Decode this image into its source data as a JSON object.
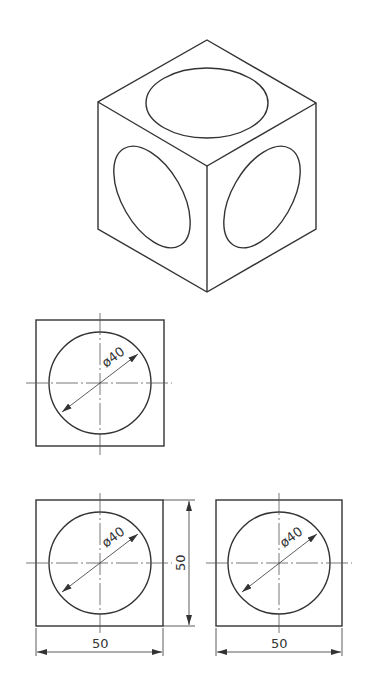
{
  "diagram": {
    "colors": {
      "line": "#333333",
      "background": "#ffffff"
    },
    "isometric": {
      "label": "isometric-view",
      "faces": [
        "top",
        "left",
        "right"
      ],
      "feature": "ellipse on each face"
    },
    "top_view": {
      "diameter_label": "ø40"
    },
    "front_view": {
      "diameter_label": "ø40",
      "width_label": "50",
      "height_label": "50"
    },
    "side_view": {
      "diameter_label": "ø40",
      "width_label": "50"
    }
  }
}
